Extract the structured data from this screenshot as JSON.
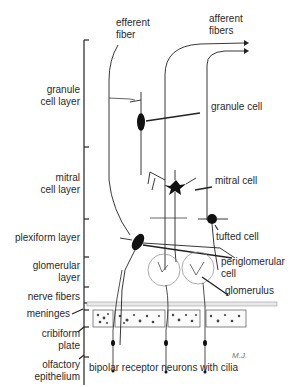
{
  "diagram": {
    "layers": [
      {
        "label_line1": "granule",
        "label_line2": "cell layer"
      },
      {
        "label_line1": "mitral",
        "label_line2": "cell layer"
      },
      {
        "label_line1": "plexiform layer",
        "label_line2": ""
      },
      {
        "label_line1": "glomerular",
        "label_line2": "layer"
      },
      {
        "label_line1": "nerve fibers",
        "label_line2": ""
      },
      {
        "label_line1": "meninges",
        "label_line2": ""
      },
      {
        "label_line1": "cribiform",
        "label_line2": "plate"
      },
      {
        "label_line1": "olfactory",
        "label_line2": "epithelium"
      }
    ],
    "top_labels": {
      "efferent_line1": "efferent",
      "efferent_line2": "fiber",
      "afferent_line1": "afferent",
      "afferent_line2": "fibers"
    },
    "cell_labels": {
      "granule_cell": "granule cell",
      "mitral_cell": "mitral cell",
      "tufted_cell": "tufted cell",
      "periglomerular_line1": "periglomerular",
      "periglomerular_line2": "cell",
      "glomerulus": "glomerulus"
    },
    "bottom_label": "bipolar receptor neurons with cilia",
    "signature": "M.J."
  }
}
